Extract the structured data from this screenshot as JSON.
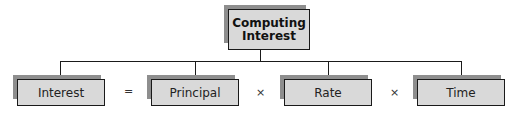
{
  "diagram": {
    "root": {
      "label_line1": "Computing",
      "label_line2": "Interest"
    },
    "nodes": [
      {
        "label": "Interest"
      },
      {
        "label": "Principal"
      },
      {
        "label": "Rate"
      },
      {
        "label": "Time"
      }
    ],
    "operators": [
      "=",
      "×",
      "×"
    ],
    "colors": {
      "box_fill": "#d9d9d9",
      "shadow": "#8e8e8e",
      "line": "#1a1a1a"
    }
  }
}
